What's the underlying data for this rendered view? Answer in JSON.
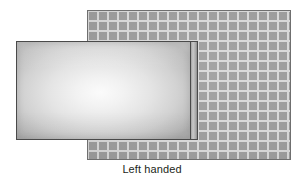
{
  "figure": {
    "caption": "Left handed",
    "background_color": "#ffffff",
    "width": 304,
    "height": 178
  },
  "grid_mat": {
    "name": "graph-paper-mat",
    "fill_color": "#9d9d9d",
    "line_color": "#d8d8d8",
    "border_color": "#6f6f6f",
    "cell_size_px": 10,
    "line_width_px": 2,
    "x": 87,
    "y": 10,
    "width": 204,
    "height": 150,
    "columns": 20,
    "rows": 15
  },
  "panel": {
    "name": "left-handed-panel",
    "border_color": "#4a4a4a",
    "center_color": "#fbfbfb",
    "edge_color": "#b2b2b2",
    "x": 16,
    "y": 41,
    "width": 175,
    "height": 99
  },
  "panel_edge": {
    "name": "panel-side-thickness",
    "highlight_color": "#c9c9c9",
    "shadow_color": "#3a3a3a",
    "x": 189,
    "y": 41,
    "width": 9,
    "height": 99
  }
}
